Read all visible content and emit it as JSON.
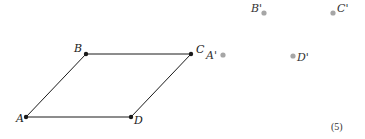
{
  "figure": {
    "number_label": "(5)",
    "parallelogram": {
      "stroke_color": "#1a1a1a",
      "vertices": [
        {
          "name": "A",
          "x": 26,
          "y": 117,
          "label_dx": -10,
          "label_dy": 5
        },
        {
          "name": "B",
          "x": 86,
          "y": 54,
          "label_dx": -12,
          "label_dy": -2
        },
        {
          "name": "C",
          "x": 191,
          "y": 54,
          "label_dx": 5,
          "label_dy": -1
        },
        {
          "name": "D",
          "x": 131,
          "y": 117,
          "label_dx": 3,
          "label_dy": 7
        }
      ]
    },
    "image_points": {
      "color": "#a6a6a6",
      "points": [
        {
          "name": "A'",
          "x": 223,
          "y": 55,
          "label_dx": -17,
          "label_dy": 4
        },
        {
          "name": "B'",
          "x": 264,
          "y": 13,
          "label_dx": -13,
          "label_dy": -1
        },
        {
          "name": "C'",
          "x": 333,
          "y": 13,
          "label_dx": 4,
          "label_dy": -1
        },
        {
          "name": "D'",
          "x": 293,
          "y": 56,
          "label_dx": 4,
          "label_dy": 5
        }
      ]
    }
  }
}
